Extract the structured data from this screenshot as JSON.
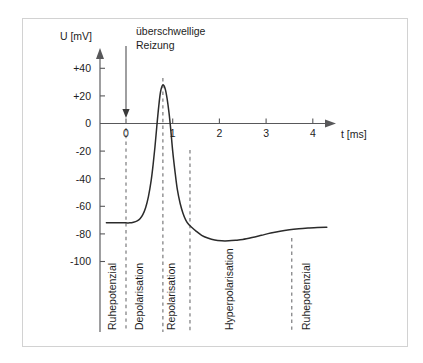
{
  "figure": {
    "annotation_line1": "überschwellige",
    "annotation_line2": "Reizung",
    "frame_color": "#d2d2d2",
    "curve_color": "#2b2b2b",
    "axis_color": "#58585a",
    "dashed_color": "#6e6e70"
  },
  "chart_data": {
    "type": "line",
    "title": "",
    "xlabel": "t [ms]",
    "ylabel": "U [mV]",
    "xlim": [
      -0.45,
      4.35
    ],
    "ylim": [
      -112,
      48
    ],
    "grid": false,
    "legend": null,
    "x_ticks": [
      "0",
      "1",
      "2",
      "3",
      "4"
    ],
    "x_tick_values": [
      0,
      1,
      2,
      3,
      4
    ],
    "y_ticks": [
      "+40",
      "+20",
      "0",
      "-20",
      "-40",
      "-60",
      "-80",
      "-100"
    ],
    "y_tick_values": [
      40,
      20,
      0,
      -20,
      -40,
      -60,
      -80,
      -100
    ],
    "series": [
      {
        "name": "Membranpotenzial",
        "x": [
          -0.42,
          -0.3,
          -0.18,
          -0.06,
          0.0,
          0.08,
          0.16,
          0.24,
          0.3,
          0.36,
          0.42,
          0.48,
          0.54,
          0.58,
          0.62,
          0.66,
          0.7,
          0.74,
          0.79,
          0.84,
          0.88,
          0.92,
          0.96,
          1.0,
          1.05,
          1.1,
          1.16,
          1.22,
          1.28,
          1.34,
          1.4,
          1.5,
          1.62,
          1.75,
          1.9,
          2.05,
          2.2,
          2.35,
          2.5,
          2.7,
          2.9,
          3.1,
          3.3,
          3.5,
          3.7,
          3.9,
          4.1,
          4.3
        ],
        "y": [
          -72,
          -72,
          -72,
          -72,
          -72,
          -72,
          -71.5,
          -70.5,
          -69,
          -66,
          -61,
          -53,
          -41,
          -30,
          -17,
          -2,
          12,
          23,
          28,
          25,
          18,
          8,
          -5,
          -20,
          -35,
          -48,
          -58,
          -65,
          -70,
          -73,
          -75,
          -78,
          -81,
          -83,
          -84.5,
          -85,
          -85,
          -84.6,
          -84,
          -82.6,
          -81,
          -79.4,
          -78,
          -77,
          -76.3,
          -75.8,
          -75.4,
          -75.2
        ]
      }
    ],
    "annotations": [
      {
        "type": "arrow",
        "label": "überschwellige Reizung",
        "x": 0.0,
        "y_from": 46,
        "y_to": 3
      }
    ],
    "markers": {
      "resting_potential_mV": -72,
      "peak_mV": 28,
      "peak_time_ms": 0.79,
      "hyperpolarization_min_mV": -85,
      "hyperpolarization_min_time_ms": 2.2,
      "final_potential_mV": -75
    },
    "phase_dividers_ms": [
      0.0,
      0.79,
      1.37,
      3.55
    ],
    "phases": [
      {
        "label": "Ruhepotenzial",
        "center_ms": -0.22
      },
      {
        "label": "Depolarisation",
        "center_ms": 0.37
      },
      {
        "label": "Repolarisation",
        "center_ms": 1.05
      },
      {
        "label": "Hyperpolarisation",
        "center_ms": 2.3
      },
      {
        "label": "Ruhepotenzial",
        "center_ms": 3.95
      }
    ]
  }
}
